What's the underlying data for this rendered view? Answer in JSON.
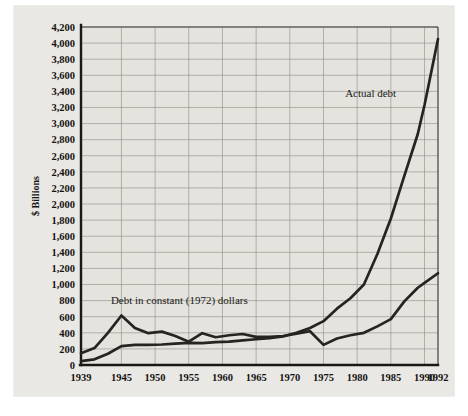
{
  "figure": {
    "name": "us-national-debt-chart",
    "background_color": "#e9e8e4",
    "plot_background_color": "#e4e3de",
    "line_color": "#262320",
    "grid_color": "#8e8b85"
  },
  "chart_data": {
    "type": "line",
    "title": "",
    "xlabel": "",
    "ylabel": "$ Billions",
    "xlim": [
      1939,
      1992
    ],
    "ylim": [
      0,
      4200
    ],
    "ytick_step": 200,
    "grid": true,
    "legend": "annotations",
    "xtick_labels": [
      "1939",
      "1945",
      "1950",
      "1955",
      "1960",
      "1965",
      "1970",
      "1975",
      "1980",
      "1985",
      "1990",
      "1992"
    ],
    "xtick_values": [
      1939,
      1945,
      1950,
      1955,
      1960,
      1965,
      1970,
      1975,
      1980,
      1985,
      1990,
      1992
    ],
    "ytick_labels": [
      "0",
      "200",
      "400",
      "600",
      "800",
      "1,000",
      "1,200",
      "1,400",
      "1,600",
      "1,800",
      "2,000",
      "2,200",
      "2,400",
      "2,600",
      "2,800",
      "3,000",
      "3,200",
      "3,400",
      "3,600",
      "3,800",
      "4,000",
      "4,200"
    ],
    "ytick_values": [
      0,
      200,
      400,
      600,
      800,
      1000,
      1200,
      1400,
      1600,
      1800,
      2000,
      2200,
      2400,
      2600,
      2800,
      3000,
      3200,
      3400,
      3600,
      3800,
      4000,
      4200
    ],
    "vgrid_values": [
      1939,
      1945,
      1950,
      1955,
      1960,
      1965,
      1970,
      1975,
      1980,
      1985,
      1990,
      1992
    ],
    "annotations": [
      {
        "text": "Actual debt",
        "x": 1982.0,
        "y": 3330
      },
      {
        "text": "Debt in constant (1972) dollars",
        "x": 1953.6,
        "y": 755
      }
    ],
    "series": [
      {
        "name": "Actual debt",
        "x": [
          1939,
          1941,
          1943,
          1945,
          1947,
          1949,
          1951,
          1953,
          1955,
          1957,
          1959,
          1961,
          1963,
          1965,
          1967,
          1969,
          1971,
          1973,
          1975,
          1977,
          1979,
          1981,
          1983,
          1985,
          1987,
          1989,
          1990,
          1992
        ],
        "values": [
          48,
          70,
          140,
          235,
          250,
          250,
          255,
          265,
          275,
          272,
          285,
          290,
          305,
          320,
          335,
          355,
          400,
          460,
          545,
          700,
          830,
          1000,
          1380,
          1820,
          2350,
          2870,
          3230,
          4050
        ]
      },
      {
        "name": "Debt in constant (1972) dollars",
        "x": [
          1939,
          1941,
          1943,
          1945,
          1947,
          1949,
          1951,
          1953,
          1955,
          1957,
          1959,
          1961,
          1963,
          1965,
          1967,
          1969,
          1971,
          1973,
          1975,
          1977,
          1979,
          1981,
          1983,
          1985,
          1987,
          1989,
          1990,
          1992
        ],
        "values": [
          145,
          210,
          400,
          615,
          460,
          395,
          415,
          360,
          290,
          395,
          345,
          370,
          385,
          350,
          350,
          360,
          390,
          420,
          250,
          330,
          370,
          400,
          480,
          570,
          790,
          960,
          1020,
          1140
        ]
      }
    ]
  }
}
